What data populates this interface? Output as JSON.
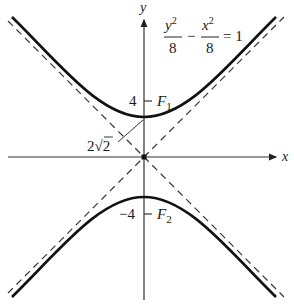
{
  "figure": {
    "type": "hyperbola",
    "equation": {
      "num1": "y",
      "num1_exp": "2",
      "den1": "8",
      "minus": "−",
      "num2": "x",
      "num2_exp": "2",
      "den2": "8",
      "rhs": "= 1"
    },
    "axes": {
      "x_label": "x",
      "y_label": "y"
    },
    "labels": {
      "tick_pos": "4",
      "tick_neg": "−4",
      "focus_upper": "F",
      "focus_upper_sub": "1",
      "focus_lower": "F",
      "focus_lower_sub": "2",
      "vertex_coef": "2",
      "vertex_radical": "√",
      "vertex_radicand": "2"
    },
    "parameters": {
      "a_squared": 8,
      "b_squared": 8,
      "vertex_distance": "2√2",
      "focus_distance": 4,
      "asymptotes": [
        "y = x",
        "y = −x"
      ]
    },
    "colors": {
      "curve": "#111111",
      "axis": "#333333",
      "asymptote": "#333333"
    }
  }
}
